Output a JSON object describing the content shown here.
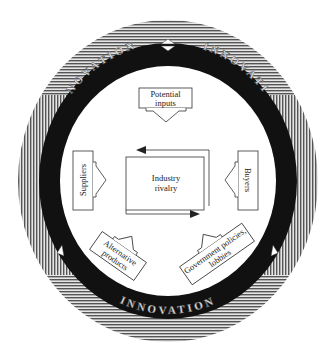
{
  "diagram": {
    "ring": {
      "label": "INNOVATION",
      "text_top_left": "NOVATION",
      "text_top_right": "INNOVATI",
      "text_left": "INN",
      "text_right": "ON",
      "text_bottom": "INNOVATION",
      "colors": {
        "stripe_dark": "#555555",
        "stripe_light": "#e6e6e6",
        "band": "#111111",
        "inner": "#ffffff"
      }
    },
    "center": {
      "line1": "Industry",
      "line2": "rivalry"
    },
    "top_box": {
      "line1": "Potential",
      "line2": "inputs"
    },
    "left_box": {
      "label": "Suppliers"
    },
    "right_box": {
      "label": "Buyers"
    },
    "bottom_left_box": {
      "line1": "Alternative",
      "line2": "products"
    },
    "bottom_right_box": {
      "line1": "Government policies,",
      "line2": "lobbies"
    }
  }
}
